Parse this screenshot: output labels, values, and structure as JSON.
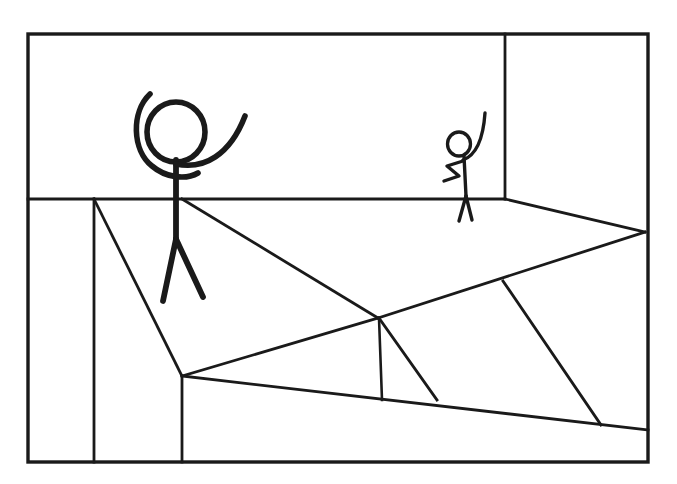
{
  "document": {
    "title": "Stick Figure Room Sketch",
    "kind": "line-drawing",
    "background_color": "#ffffff",
    "ink_color": "#1a1a1a",
    "canvas": {
      "width": 677,
      "height": 484
    }
  },
  "scene": {
    "description": "Black-ink line sketch of a room interior: a rectangular outer frame, a back wall with a corner edge, a floor divided by straight lines, a large stick figure with both arms raised standing in the foreground and a small stick figure with one arm raised standing at the back wall.",
    "stroke_width_frame": 3.2,
    "stroke_width_line": 2.6,
    "stroke_width_figure": 5.5,
    "stroke_width_figure_small": 3.2
  },
  "frame": {
    "name": "outer-border",
    "x": 28,
    "y": 34,
    "width": 620,
    "height": 428,
    "stroke": "#1a1a1a",
    "stroke_width": 3.4
  },
  "room_lines": [
    {
      "name": "wall-floor-horizon",
      "type": "polyline",
      "points": "28,199 505,199",
      "stroke_width": 2.8
    },
    {
      "name": "wall-corner-vertical",
      "type": "polyline",
      "points": "505,34 505,199",
      "stroke_width": 2.8
    },
    {
      "name": "left-wall-vertical",
      "type": "polyline",
      "points": "94,199 94,462",
      "stroke_width": 2.8
    },
    {
      "name": "left-floor-diagonal",
      "type": "polyline",
      "points": "94,199 182,376",
      "stroke_width": 2.8
    },
    {
      "name": "left-panel-vertical",
      "type": "polyline",
      "points": "182,376 182,462",
      "stroke_width": 2.8
    },
    {
      "name": "floor-diagonal-upper-left",
      "type": "polyline",
      "points": "182,199 378,318",
      "stroke_width": 2.8
    },
    {
      "name": "floor-diagonal-to-right-wall",
      "type": "polyline",
      "points": "378,318 645,232",
      "stroke_width": 2.8
    },
    {
      "name": "floor-diagonal-back-right",
      "type": "polyline",
      "points": "505,199 645,232",
      "stroke_width": 2.8
    },
    {
      "name": "floor-diagonal-lower-left",
      "type": "polyline",
      "points": "182,376 378,318",
      "stroke_width": 2.8
    },
    {
      "name": "floor-vertical-short",
      "type": "polyline",
      "points": "379,318 382,400",
      "stroke_width": 2.6
    },
    {
      "name": "floor-diagonal-small-wedge",
      "type": "polyline",
      "points": "379,318 437,400",
      "stroke_width": 2.8
    },
    {
      "name": "floor-front-edge",
      "type": "polyline",
      "points": "182,376 648,430",
      "stroke_width": 2.8
    },
    {
      "name": "floor-diagonal-right-long",
      "type": "polyline",
      "points": "503,281 601,425",
      "stroke_width": 2.8
    }
  ],
  "figures": [
    {
      "name": "large-stick-figure",
      "label": "Large stick figure with both arms raised",
      "head": {
        "cx": 176,
        "cy": 132,
        "rx": 29,
        "ry": 30,
        "stroke_width": 5.6
      },
      "parts": [
        {
          "name": "torso",
          "type": "path",
          "d": "M 176 160 L 176 239",
          "stroke_width": 5.8
        },
        {
          "name": "left-leg",
          "type": "path",
          "d": "M 176 239 L 163 301",
          "stroke_width": 5.8
        },
        {
          "name": "right-leg",
          "type": "path",
          "d": "M 176 239 L 203 297",
          "stroke_width": 5.8
        },
        {
          "name": "left-arm-raised",
          "type": "path",
          "d": "M 150 94 C 131 112 132 150 152 166 C 166 178 186 180 198 173",
          "stroke_width": 5.6
        },
        {
          "name": "right-arm-raised",
          "type": "path",
          "d": "M 176 164 C 204 170 230 155 245 116",
          "stroke_width": 5.6
        }
      ]
    },
    {
      "name": "small-stick-figure",
      "label": "Small stick figure with one arm raised",
      "head": {
        "cx": 459,
        "cy": 144,
        "rx": 11.5,
        "ry": 12,
        "stroke_width": 3.3
      },
      "parts": [
        {
          "name": "torso",
          "type": "path",
          "d": "M 464 156 L 466 196",
          "stroke_width": 3.4
        },
        {
          "name": "left-leg",
          "type": "path",
          "d": "M 466 196 L 459 221",
          "stroke_width": 3.4
        },
        {
          "name": "right-leg",
          "type": "path",
          "d": "M 466 196 L 472 220",
          "stroke_width": 3.4
        },
        {
          "name": "raised-arm",
          "type": "path",
          "d": "M 463 160 C 474 156 483 142 485 113",
          "stroke_width": 3.4
        },
        {
          "name": "bent-arm",
          "type": "path",
          "d": "M 463 161 L 447 166 L 459 176 L 444 181",
          "stroke_width": 3.4
        }
      ]
    }
  ]
}
